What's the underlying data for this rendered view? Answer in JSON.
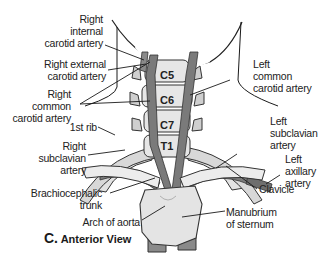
{
  "figure": {
    "caption_letter": "C.",
    "caption_text": "Anterior View",
    "labels": {
      "right_internal_carotid": [
        "Right",
        "internal",
        "carotid artery"
      ],
      "right_external_carotid": [
        "Right external",
        "carotid artery"
      ],
      "right_common_carotid": [
        "Right",
        "common",
        "carotid artery"
      ],
      "first_rib": "1st rib",
      "right_subclavian": [
        "Right",
        "subclavian",
        "artery"
      ],
      "brachiocephalic_trunk": [
        "Brachiocephalic",
        "trunk"
      ],
      "arch_of_aorta": "Arch of aorta",
      "left_common_carotid": [
        "Left",
        "common",
        "carotid artery"
      ],
      "left_subclavian": [
        "Left",
        "subclavian",
        "artery"
      ],
      "left_axillary": [
        "Left",
        "axillary",
        "artery"
      ],
      "clavicle": "Clavicle",
      "manubrium": [
        "Manubrium",
        "of sternum"
      ]
    },
    "vertebrae": [
      "C5",
      "C6",
      "C7",
      "T1"
    ],
    "colors": {
      "bone_light": "#e6e6e6",
      "bone_mid": "#c8c8c8",
      "bone_dark": "#8c8c8c",
      "artery": "#6e6e6e",
      "outline": "#333333",
      "line": "#1a1a1a"
    }
  }
}
